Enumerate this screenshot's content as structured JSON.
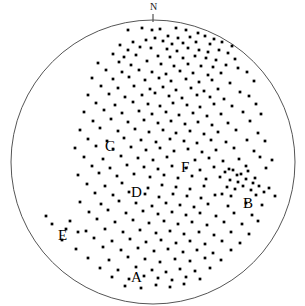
{
  "figure": {
    "type": "stereonet-scatter",
    "background_color": "#ffffff",
    "circle": {
      "center_x": 153,
      "center_y": 162,
      "radius": 142,
      "stroke_color": "#555555",
      "stroke_width": 1,
      "fill": "none"
    },
    "north_tick": {
      "label": "N",
      "label_x": 150,
      "label_y": 3,
      "tick_x": 153,
      "tick_y1": 14,
      "tick_y2": 22,
      "color": "#1a1a1a"
    },
    "point_style": {
      "color": "#000000",
      "radius": 1.35,
      "shape": "square-dot"
    }
  },
  "labels": [
    {
      "text": "A",
      "x": 131,
      "y": 270
    },
    {
      "text": "B",
      "x": 243,
      "y": 196
    },
    {
      "text": "C",
      "x": 105,
      "y": 139
    },
    {
      "text": "D",
      "x": 131,
      "y": 185
    },
    {
      "text": "E",
      "x": 58,
      "y": 228
    },
    {
      "text": "F",
      "x": 181,
      "y": 160
    }
  ],
  "chart_data": {
    "type": "scatter",
    "title": "",
    "xlabel": "",
    "ylabel": "",
    "grid": false,
    "legend": null,
    "projection": "equal-area lower hemisphere stereographic net",
    "orientation_marker": "N",
    "clusters": [
      "A",
      "B",
      "C",
      "D",
      "E",
      "F"
    ],
    "point_count": 258,
    "points": [
      [
        128,
        30
      ],
      [
        142,
        28
      ],
      [
        152,
        30
      ],
      [
        160,
        29
      ],
      [
        176,
        28
      ],
      [
        186,
        30
      ],
      [
        198,
        33
      ],
      [
        168,
        36
      ],
      [
        155,
        38
      ],
      [
        146,
        40
      ],
      [
        178,
        38
      ],
      [
        190,
        37
      ],
      [
        205,
        36
      ],
      [
        214,
        39
      ],
      [
        133,
        42
      ],
      [
        120,
        45
      ],
      [
        163,
        41
      ],
      [
        172,
        44
      ],
      [
        183,
        43
      ],
      [
        196,
        42
      ],
      [
        210,
        44
      ],
      [
        222,
        42
      ],
      [
        232,
        46
      ],
      [
        128,
        50
      ],
      [
        140,
        47
      ],
      [
        151,
        48
      ],
      [
        167,
        49
      ],
      [
        177,
        51
      ],
      [
        188,
        48
      ],
      [
        199,
        50
      ],
      [
        208,
        52
      ],
      [
        219,
        50
      ],
      [
        228,
        53
      ],
      [
        242,
        52
      ],
      [
        113,
        54
      ],
      [
        124,
        57
      ],
      [
        136,
        55
      ],
      [
        158,
        56
      ],
      [
        170,
        57
      ],
      [
        183,
        58
      ],
      [
        195,
        56
      ],
      [
        206,
        58
      ],
      [
        216,
        60
      ],
      [
        235,
        59
      ],
      [
        98,
        63
      ],
      [
        119,
        62
      ],
      [
        131,
        65
      ],
      [
        147,
        61
      ],
      [
        161,
        64
      ],
      [
        174,
        66
      ],
      [
        188,
        64
      ],
      [
        201,
        66
      ],
      [
        213,
        67
      ],
      [
        226,
        65
      ],
      [
        238,
        68
      ],
      [
        106,
        70
      ],
      [
        122,
        72
      ],
      [
        139,
        70
      ],
      [
        152,
        72
      ],
      [
        166,
        74
      ],
      [
        180,
        71
      ],
      [
        193,
        73
      ],
      [
        208,
        75
      ],
      [
        221,
        73
      ],
      [
        247,
        72
      ],
      [
        92,
        78
      ],
      [
        113,
        79
      ],
      [
        129,
        77
      ],
      [
        145,
        80
      ],
      [
        159,
        78
      ],
      [
        171,
        81
      ],
      [
        186,
        79
      ],
      [
        199,
        82
      ],
      [
        212,
        80
      ],
      [
        230,
        83
      ],
      [
        254,
        81
      ],
      [
        101,
        86
      ],
      [
        118,
        88
      ],
      [
        134,
        86
      ],
      [
        150,
        89
      ],
      [
        163,
        87
      ],
      [
        176,
        90
      ],
      [
        191,
        88
      ],
      [
        204,
        91
      ],
      [
        218,
        89
      ],
      [
        240,
        92
      ],
      [
        88,
        95
      ],
      [
        109,
        94
      ],
      [
        125,
        97
      ],
      [
        142,
        95
      ],
      [
        155,
        93
      ],
      [
        169,
        96
      ],
      [
        182,
        98
      ],
      [
        197,
        95
      ],
      [
        210,
        97
      ],
      [
        224,
        99
      ],
      [
        249,
        96
      ],
      [
        96,
        103
      ],
      [
        115,
        105
      ],
      [
        133,
        102
      ],
      [
        148,
        104
      ],
      [
        160,
        106
      ],
      [
        173,
        103
      ],
      [
        187,
        105
      ],
      [
        200,
        107
      ],
      [
        214,
        104
      ],
      [
        232,
        106
      ],
      [
        256,
        104
      ],
      [
        84,
        112
      ],
      [
        104,
        110
      ],
      [
        122,
        113
      ],
      [
        139,
        111
      ],
      [
        152,
        114
      ],
      [
        166,
        112
      ],
      [
        179,
        115
      ],
      [
        193,
        113
      ],
      [
        207,
        116
      ],
      [
        221,
        114
      ],
      [
        243,
        112
      ],
      [
        261,
        114
      ],
      [
        93,
        121
      ],
      [
        111,
        119
      ],
      [
        128,
        122
      ],
      [
        144,
        120
      ],
      [
        158,
        123
      ],
      [
        171,
        121
      ],
      [
        185,
        124
      ],
      [
        198,
        122
      ],
      [
        212,
        125
      ],
      [
        228,
        123
      ],
      [
        250,
        121
      ],
      [
        80,
        130
      ],
      [
        100,
        128
      ],
      [
        118,
        131
      ],
      [
        135,
        129
      ],
      [
        149,
        132
      ],
      [
        163,
        130
      ],
      [
        176,
        133
      ],
      [
        190,
        131
      ],
      [
        204,
        134
      ],
      [
        218,
        132
      ],
      [
        236,
        130
      ],
      [
        258,
        133
      ],
      [
        88,
        139
      ],
      [
        107,
        141
      ],
      [
        124,
        138
      ],
      [
        141,
        140
      ],
      [
        156,
        142
      ],
      [
        170,
        139
      ],
      [
        184,
        141
      ],
      [
        197,
        143
      ],
      [
        211,
        140
      ],
      [
        226,
        142
      ],
      [
        247,
        140
      ],
      [
        265,
        141
      ],
      [
        75,
        148
      ],
      [
        96,
        146
      ],
      [
        113,
        149
      ],
      [
        131,
        147
      ],
      [
        146,
        150
      ],
      [
        160,
        148
      ],
      [
        174,
        151
      ],
      [
        188,
        149
      ],
      [
        202,
        152
      ],
      [
        216,
        150
      ],
      [
        234,
        148
      ],
      [
        254,
        151
      ],
      [
        84,
        157
      ],
      [
        103,
        159
      ],
      [
        121,
        156
      ],
      [
        138,
        158
      ],
      [
        153,
        160
      ],
      [
        167,
        157
      ],
      [
        195,
        160
      ],
      [
        209,
        158
      ],
      [
        223,
        161
      ],
      [
        239,
        159
      ],
      [
        260,
        157
      ],
      [
        272,
        160
      ],
      [
        92,
        166
      ],
      [
        110,
        168
      ],
      [
        127,
        165
      ],
      [
        144,
        167
      ],
      [
        158,
        169
      ],
      [
        172,
        166
      ],
      [
        186,
        168
      ],
      [
        200,
        170
      ],
      [
        214,
        167
      ],
      [
        229,
        169
      ],
      [
        246,
        166
      ],
      [
        266,
        168
      ],
      [
        78,
        175
      ],
      [
        99,
        173
      ],
      [
        117,
        176
      ],
      [
        134,
        174
      ],
      [
        150,
        177
      ],
      [
        164,
        175
      ],
      [
        178,
        178
      ],
      [
        192,
        176
      ],
      [
        206,
        179
      ],
      [
        220,
        177
      ],
      [
        237,
        175
      ],
      [
        255,
        178
      ],
      [
        225,
        172
      ],
      [
        233,
        170
      ],
      [
        241,
        174
      ],
      [
        248,
        171
      ],
      [
        230,
        180
      ],
      [
        238,
        182
      ],
      [
        246,
        179
      ],
      [
        253,
        183
      ],
      [
        227,
        187
      ],
      [
        235,
        189
      ],
      [
        243,
        186
      ],
      [
        251,
        190
      ],
      [
        259,
        186
      ],
      [
        222,
        194
      ],
      [
        231,
        196
      ],
      [
        256,
        195
      ],
      [
        264,
        192
      ],
      [
        87,
        184
      ],
      [
        105,
        186
      ],
      [
        122,
        183
      ],
      [
        148,
        188
      ],
      [
        162,
        185
      ],
      [
        176,
        187
      ],
      [
        190,
        189
      ],
      [
        204,
        186
      ],
      [
        269,
        188
      ],
      [
        95,
        193
      ],
      [
        113,
        195
      ],
      [
        129,
        192
      ],
      [
        145,
        194
      ],
      [
        159,
        197
      ],
      [
        173,
        194
      ],
      [
        187,
        196
      ],
      [
        201,
        198
      ],
      [
        215,
        195
      ],
      [
        275,
        196
      ],
      [
        80,
        202
      ],
      [
        101,
        204
      ],
      [
        119,
        201
      ],
      [
        136,
        203
      ],
      [
        152,
        206
      ],
      [
        166,
        203
      ],
      [
        180,
        205
      ],
      [
        194,
        207
      ],
      [
        208,
        204
      ],
      [
        228,
        206
      ],
      [
        246,
        203
      ],
      [
        262,
        205
      ],
      [
        89,
        212
      ],
      [
        108,
        210
      ],
      [
        126,
        213
      ],
      [
        143,
        211
      ],
      [
        158,
        214
      ],
      [
        172,
        212
      ],
      [
        186,
        215
      ],
      [
        200,
        213
      ],
      [
        216,
        216
      ],
      [
        234,
        213
      ],
      [
        252,
        215
      ],
      [
        70,
        221
      ],
      [
        97,
        219
      ],
      [
        115,
        222
      ],
      [
        133,
        220
      ],
      [
        149,
        223
      ],
      [
        164,
        221
      ],
      [
        178,
        224
      ],
      [
        192,
        222
      ],
      [
        207,
        225
      ],
      [
        224,
        222
      ],
      [
        242,
        224
      ],
      [
        258,
        221
      ],
      [
        46,
        216
      ],
      [
        52,
        224
      ],
      [
        66,
        229
      ],
      [
        78,
        232
      ],
      [
        86,
        231
      ],
      [
        105,
        229
      ],
      [
        123,
        232
      ],
      [
        140,
        230
      ],
      [
        156,
        233
      ],
      [
        170,
        231
      ],
      [
        184,
        234
      ],
      [
        199,
        232
      ],
      [
        214,
        235
      ],
      [
        231,
        232
      ],
      [
        249,
        234
      ],
      [
        62,
        240
      ],
      [
        94,
        238
      ],
      [
        112,
        241
      ],
      [
        130,
        239
      ],
      [
        146,
        242
      ],
      [
        161,
        240
      ],
      [
        176,
        243
      ],
      [
        190,
        241
      ],
      [
        205,
        244
      ],
      [
        222,
        241
      ],
      [
        240,
        243
      ],
      [
        76,
        249
      ],
      [
        103,
        247
      ],
      [
        121,
        250
      ],
      [
        138,
        248
      ],
      [
        154,
        251
      ],
      [
        168,
        249
      ],
      [
        183,
        252
      ],
      [
        197,
        250
      ],
      [
        213,
        253
      ],
      [
        231,
        250
      ],
      [
        88,
        258
      ],
      [
        109,
        260
      ],
      [
        128,
        257
      ],
      [
        145,
        259
      ],
      [
        160,
        262
      ],
      [
        175,
        259
      ],
      [
        190,
        261
      ],
      [
        205,
        258
      ],
      [
        221,
        260
      ],
      [
        100,
        268
      ],
      [
        118,
        270
      ],
      [
        136,
        267
      ],
      [
        152,
        270
      ],
      [
        166,
        272
      ],
      [
        180,
        269
      ],
      [
        195,
        271
      ],
      [
        210,
        268
      ],
      [
        112,
        277
      ],
      [
        129,
        279
      ],
      [
        144,
        276
      ],
      [
        158,
        278
      ],
      [
        172,
        280
      ],
      [
        186,
        277
      ],
      [
        200,
        279
      ],
      [
        125,
        286
      ],
      [
        141,
        288
      ],
      [
        156,
        285
      ],
      [
        170,
        287
      ],
      [
        184,
        284
      ]
    ]
  }
}
